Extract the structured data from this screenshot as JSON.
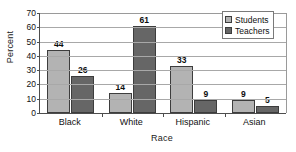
{
  "chart_data": {
    "type": "bar",
    "title": "",
    "xlabel": "Race",
    "ylabel": "Percent",
    "categories": [
      "Black",
      "White",
      "Hispanic",
      "Asian"
    ],
    "series": [
      {
        "name": "Students",
        "values": [
          44,
          14,
          33,
          9
        ],
        "color": "#b3b3b3"
      },
      {
        "name": "Teachers",
        "values": [
          26,
          61,
          9,
          5
        ],
        "color": "#666666"
      }
    ],
    "ylim": [
      0,
      70
    ],
    "ytick_step": 10,
    "yticks": [
      0,
      10,
      20,
      30,
      40,
      50,
      60,
      70
    ],
    "ytick_labels": [
      "0",
      "10",
      "20",
      "30",
      "40",
      "50",
      "60",
      "70"
    ],
    "grid": true,
    "grid_axis": "y",
    "legend_position": "top-right",
    "data_labels": true,
    "data_label_values": [
      [
        "44",
        "26"
      ],
      [
        "14",
        "61"
      ],
      [
        "33",
        "9"
      ],
      [
        "9",
        "5"
      ]
    ]
  },
  "legend": {
    "items": [
      {
        "label": "Students",
        "swatch": "students-swatch-icon"
      },
      {
        "label": "Teachers",
        "swatch": "teachers-swatch-icon"
      }
    ]
  },
  "axes": {
    "y_title": "Percent",
    "x_title": "Race"
  }
}
